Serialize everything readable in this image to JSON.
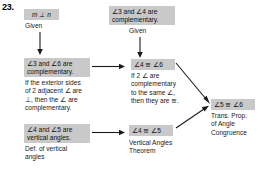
{
  "problem": {
    "number": "23."
  },
  "flowchart": {
    "type": "geometry-proof-flowchart",
    "boxes": [
      {
        "id": "given-mn",
        "text": "m ⊥ n",
        "reason": "Given"
      },
      {
        "id": "given-34-comp",
        "text": "∠3 and ∠4 are\ncomplementary.",
        "reason": "Given"
      },
      {
        "id": "36-comp",
        "text": "∠3 and ∠6 are\ncomplementary.",
        "reason": "If the exterior sides\nof 2 adjacent ∠ are\n⊥, then the ∠ are\ncomplementary."
      },
      {
        "id": "a4-cong-a6",
        "text": "∠4 ≅ ∠6",
        "reason": "If 2 ∠ are\ncomplementary\nto the same ∠,\nthen they are ≅."
      },
      {
        "id": "45-vertical",
        "text": "∠4 and ∠5 are\nvertical angles.",
        "reason": "Def. of vertical\nangles"
      },
      {
        "id": "a4-cong-a5",
        "text": "∠4 ≅ ∠5",
        "reason": "Vertical Angles\nTheorem"
      },
      {
        "id": "a5-cong-a6",
        "text": "∠5 ≅ ∠6",
        "reason": "Trans. Prop.\nof Angle\nCongruence"
      }
    ],
    "colors": {
      "box_fill": "#c9c9c9",
      "text": "#1a1a1a",
      "arrow": "#1a1a1a",
      "background": "#ffffff"
    }
  }
}
